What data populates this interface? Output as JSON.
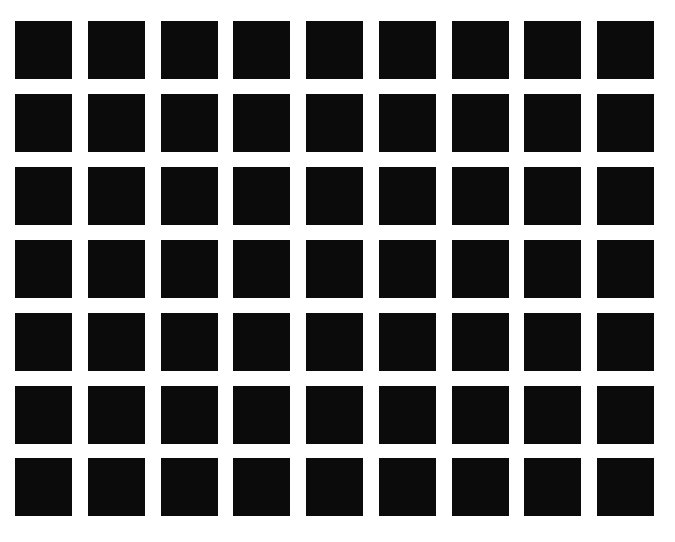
{
  "figure": {
    "rows": 7,
    "cols": 9,
    "square_color": "#0b0b0b",
    "background_color": "#ffffff",
    "origin_x": 15,
    "origin_y": 21,
    "pitch_x": 72.75,
    "pitch_y": 72.9,
    "square_width": 57,
    "square_height": 58
  }
}
